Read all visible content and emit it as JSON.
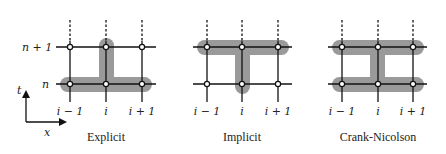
{
  "colors": {
    "highlight": "#9a9a9a",
    "grid": "#111111",
    "node_fill": "#ffffff",
    "background": "#ffffff"
  },
  "row_labels": {
    "upper": "n + 1",
    "lower": "n"
  },
  "axis_labels": {
    "time": "t",
    "space": "x"
  },
  "panels": [
    {
      "id": "explicit",
      "caption": "Explicit",
      "column_labels": [
        "i − 1",
        "i",
        "i + 1"
      ]
    },
    {
      "id": "implicit",
      "caption": "Implicit",
      "column_labels": [
        "i − 1",
        "i",
        "i + 1"
      ]
    },
    {
      "id": "crank-nicolson",
      "caption": "Crank-Nicolson",
      "column_labels": [
        "i − 1",
        "i",
        "i + 1"
      ]
    }
  ]
}
